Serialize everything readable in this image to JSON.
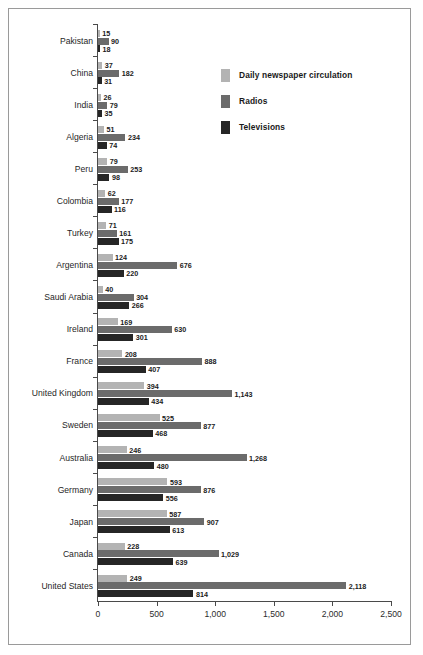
{
  "chart_data": {
    "type": "bar",
    "orientation": "horizontal",
    "title": "",
    "subtitle": "",
    "xlabel": "",
    "ylabel": "",
    "xlim": [
      0,
      2500
    ],
    "xticks": [
      0,
      500,
      1000,
      1500,
      2000,
      2500
    ],
    "xtick_labels": [
      "0",
      "500",
      "1,000",
      "1,500",
      "2,000",
      "2,500"
    ],
    "grid": false,
    "legend_position": "upper-right-inside",
    "categories": [
      "Pakistan",
      "China",
      "India",
      "Algeria",
      "Peru",
      "Colombia",
      "Turkey",
      "Argentina",
      "Saudi Arabia",
      "Ireland",
      "France",
      "United Kingdom",
      "Sweden",
      "Australia",
      "Germany",
      "Japan",
      "Canada",
      "United States"
    ],
    "series": [
      {
        "name": "Daily newspaper circulation",
        "color": "#b3b3b3",
        "values": [
          15,
          37,
          26,
          51,
          79,
          62,
          71,
          124,
          40,
          169,
          208,
          394,
          525,
          246,
          593,
          587,
          228,
          249
        ],
        "value_labels": [
          "15",
          "37",
          "26",
          "51",
          "79",
          "62",
          "71",
          "124",
          "40",
          "169",
          "208",
          "394",
          "525",
          "246",
          "593",
          "587",
          "228",
          "249"
        ]
      },
      {
        "name": "Radios",
        "color": "#6b6b6b",
        "values": [
          90,
          182,
          79,
          234,
          253,
          177,
          161,
          676,
          304,
          630,
          888,
          1143,
          877,
          1268,
          876,
          907,
          1029,
          2118
        ],
        "value_labels": [
          "90",
          "182",
          "79",
          "234",
          "253",
          "177",
          "161",
          "676",
          "304",
          "630",
          "888",
          "1,143",
          "877",
          "1,268",
          "876",
          "907",
          "1,029",
          "2,118"
        ]
      },
      {
        "name": "Televisions",
        "color": "#262626",
        "values": [
          18,
          31,
          35,
          74,
          98,
          116,
          175,
          220,
          266,
          301,
          407,
          434,
          468,
          480,
          556,
          613,
          639,
          814
        ],
        "value_labels": [
          "18",
          "31",
          "35",
          "74",
          "98",
          "116",
          "175",
          "220",
          "266",
          "301",
          "407",
          "434",
          "468",
          "480",
          "556",
          "613",
          "639",
          "814"
        ]
      }
    ]
  },
  "legend": {
    "items": [
      {
        "label": "Daily newspaper circulation",
        "color": "#b3b3b3"
      },
      {
        "label": "Radios",
        "color": "#6b6b6b"
      },
      {
        "label": "Televisions",
        "color": "#262626"
      }
    ]
  }
}
